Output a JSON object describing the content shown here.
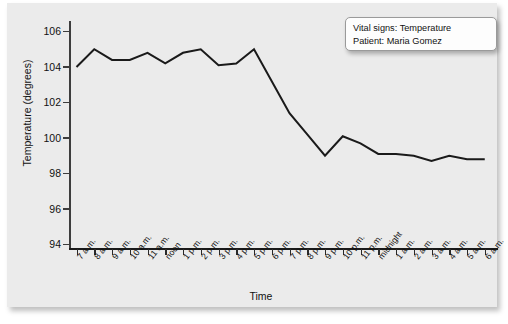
{
  "chart_data": {
    "type": "line",
    "title": "",
    "xlabel": "Time",
    "ylabel": "Temperature (degrees)",
    "ylim": [
      94,
      106
    ],
    "yticks": [
      94,
      96,
      98,
      100,
      102,
      104,
      106
    ],
    "grid": false,
    "legend_position": "top-right",
    "categories": [
      "7 a.m.",
      "8 a.m.",
      "9 a.m.",
      "10 a.m.",
      "11 a.m.",
      "noon",
      "1 p.m.",
      "2 p.m.",
      "3 p.m.",
      "4 p.m.",
      "5 p.m.",
      "6 p.m.",
      "7 p.m.",
      "8 p.m.",
      "9 p.m.",
      "10 p.m.",
      "11 p.m.",
      "midnight",
      "1 a.m.",
      "2 a.m.",
      "3 a.m.",
      "4 a.m.",
      "5 a.m.",
      "6 a.m."
    ],
    "values": [
      104.0,
      105.0,
      104.4,
      104.4,
      104.8,
      104.2,
      104.8,
      105.0,
      104.1,
      104.2,
      105.0,
      103.2,
      101.4,
      100.2,
      99.0,
      100.1,
      99.7,
      99.1,
      99.1,
      99.0,
      98.7,
      99.0,
      98.8,
      98.8
    ],
    "series_color": "#1a1a1a",
    "annotations": [
      "Vital signs: Temperature",
      "Patient: Maria Gomez"
    ]
  },
  "legend": {
    "line1": "Vital signs: Temperature",
    "line2": "Patient: Maria Gomez"
  },
  "axes": {
    "y_title": "Temperature (degrees)",
    "x_title": "Time",
    "y_tick_labels": [
      "106",
      "104",
      "102",
      "100",
      "98",
      "96",
      "94"
    ],
    "x_tick_labels": [
      "7 a.m.",
      "8 a.m.",
      "9 a.m.",
      "10 a.m.",
      "11 a.m.",
      "noon",
      "1 p.m.",
      "2 p.m.",
      "3 p.m.",
      "4 p.m.",
      "5 p.m.",
      "6 p.m.",
      "7 p.m.",
      "8 p.m.",
      "9 p.m.",
      "10 p.m.",
      "11 p.m.",
      "midnight",
      "1 a.m.",
      "2 a.m.",
      "3 a.m.",
      "4 a.m.",
      "5 a.m.",
      "6 a.m."
    ]
  },
  "colors": {
    "panel_background": "#ebebeb",
    "page_background": "#ffffff",
    "line": "#1a1a1a",
    "axis": "#3d3d3d",
    "legend_background": "#fdfdfd"
  }
}
